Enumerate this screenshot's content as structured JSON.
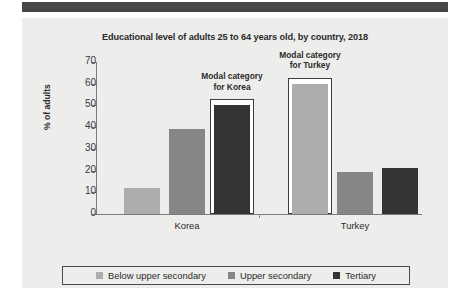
{
  "chart_data": {
    "type": "bar",
    "title": "Educational level of adults 25 to 64 years old, by country, 2018",
    "xlabel": "",
    "ylabel": "% of adults",
    "ylim": [
      0,
      70
    ],
    "ytick_values": [
      0,
      10,
      20,
      30,
      40,
      50,
      60,
      70
    ],
    "ytick_labels": [
      "0",
      "10",
      "20",
      "30",
      "40",
      "50",
      "60",
      "70"
    ],
    "grid": false,
    "legend_position": "bottom",
    "categories": [
      "Korea",
      "Turkey"
    ],
    "series": [
      {
        "name": "Below upper secondary",
        "values": [
          12,
          60
        ],
        "color": "#adadad"
      },
      {
        "name": "Upper secondary",
        "values": [
          39,
          19.5
        ],
        "color": "#868686"
      },
      {
        "name": "Tertiary",
        "values": [
          50,
          21
        ],
        "color": "#333333"
      }
    ],
    "annotations": [
      {
        "id": "korea-modal",
        "line1": "Modal category",
        "line2": "for Korea",
        "target_category": "Korea",
        "target_series": "Tertiary"
      },
      {
        "id": "turkey-modal",
        "line1": "Modal category",
        "line2": "for Turkey",
        "target_category": "Turkey",
        "target_series": "Below upper secondary"
      }
    ],
    "highlight_color": "#3d3d3d"
  },
  "colors": {
    "banner": "#474747",
    "panel_background": "#ededeb",
    "axis": "#7a7a7a",
    "text": "#2b2b2b"
  }
}
